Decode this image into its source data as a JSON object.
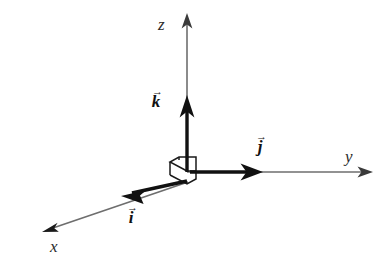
{
  "figure": {
    "background_color": "#ffffff",
    "width": 378,
    "height": 268,
    "origin": {
      "x": 187,
      "y": 172
    }
  },
  "colors": {
    "axis_line": "#6e6e6e",
    "vector_line": "#111111",
    "label_text": "#2b2b2b",
    "cube_outline": "#1a1a1a"
  },
  "axes": [
    {
      "id": "z",
      "label": "z",
      "label_position": {
        "x": 158,
        "y": 16
      },
      "from": {
        "x": 187,
        "y": 172
      },
      "to": {
        "x": 187,
        "y": 14
      },
      "arrow": "thin"
    },
    {
      "id": "y",
      "label": "y",
      "label_position": {
        "x": 345,
        "y": 148
      },
      "from": {
        "x": 187,
        "y": 172
      },
      "to": {
        "x": 373,
        "y": 172
      },
      "arrow": "thin"
    },
    {
      "id": "x",
      "label": "x",
      "label_position": {
        "x": 50,
        "y": 238
      },
      "from": {
        "x": 187,
        "y": 182
      },
      "to": {
        "x": 42,
        "y": 232
      },
      "arrow": "thin"
    }
  ],
  "vectors": [
    {
      "id": "k",
      "label": "k",
      "accent": "vector-arrow-accent",
      "label_position": {
        "x": 151,
        "y": 88
      },
      "from": {
        "x": 187,
        "y": 170
      },
      "to": {
        "x": 187,
        "y": 95
      },
      "arrow": "thick"
    },
    {
      "id": "j",
      "label": "j",
      "accent": "vector-arrow-accent",
      "label_position": {
        "x": 255,
        "y": 133
      },
      "from": {
        "x": 190,
        "y": 172
      },
      "to": {
        "x": 263,
        "y": 172
      },
      "arrow": "thick"
    },
    {
      "id": "i",
      "label": "i",
      "accent": "vector-arrow-accent",
      "label_position": {
        "x": 126,
        "y": 204
      },
      "from": {
        "x": 186,
        "y": 182
      },
      "to": {
        "x": 121,
        "y": 196
      },
      "arrow": "thick"
    }
  ],
  "origin_marker": {
    "name": "unit-cube-outline",
    "description": "small wireframe unit cube drawn at the origin"
  }
}
